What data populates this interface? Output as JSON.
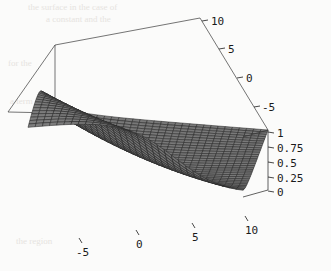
{
  "figure": {
    "kind": "3d-surface-plot",
    "style": "wireframe-mesh-grayscale",
    "background": "#fbfbfa",
    "surface_fill": "#7a7a7a",
    "surface_fill_dark": "#5d5d5d",
    "mesh_line_color": "#262626",
    "box_line_color": "#3a3a3a",
    "label_color": "#1a1a1a"
  },
  "chart_data": {
    "type": "surface",
    "title": "",
    "xlabel": "",
    "ylabel": "",
    "zlabel": "",
    "grid": false,
    "legend": null,
    "projection": "isometric-3d-boxed",
    "axes": {
      "x": {
        "position": "bottom-front",
        "ticks": [
          -5,
          0,
          5,
          10
        ],
        "tick_labels": [
          "-5",
          "0",
          "5",
          "10"
        ],
        "range": [
          -7.5,
          11.5
        ],
        "direction": "increasing-right"
      },
      "y": {
        "position": "right-rear",
        "ticks": [
          10,
          5,
          0,
          -5
        ],
        "tick_labels": [
          "10",
          "5",
          "0",
          "-5"
        ],
        "range": [
          -7.5,
          11.5
        ],
        "direction": "decreasing-downward"
      },
      "z": {
        "position": "right-vertical",
        "ticks": [
          1,
          0.75,
          0.5,
          0.25,
          0
        ],
        "tick_labels": [
          "1",
          "0.75",
          "0.5",
          "0.25",
          "0"
        ],
        "range": [
          0,
          1
        ],
        "direction": "increasing-upward"
      }
    },
    "surface": {
      "description": "Smooth sigmoid step surface rising from a flat plateau at z=0 in the front/right region to a flat plateau at z=1 in the back/left region, with a rounded diagonal transition ridge.",
      "z_min": 0,
      "z_max": 1,
      "mesh_divisions_u": 30,
      "mesh_divisions_v": 30,
      "plateau_low": 0,
      "plateau_high": 1,
      "transition": "sigmoid"
    }
  },
  "labels": {
    "y_axis": [
      "10",
      "5",
      "0",
      "-5"
    ],
    "z_axis": [
      "1",
      "0.75",
      "0.5",
      "0.25",
      "0"
    ],
    "x_axis": [
      "-5",
      "0",
      "5",
      "10"
    ]
  }
}
